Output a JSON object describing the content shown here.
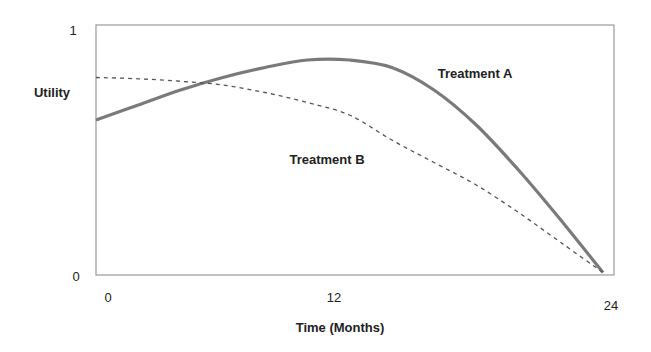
{
  "chart_data": {
    "type": "line",
    "title": "",
    "xlabel": "Time (Months)",
    "ylabel": "Utility",
    "xlim": [
      0,
      24
    ],
    "ylim": [
      0,
      1
    ],
    "x_ticks": [
      "0",
      "12",
      "24"
    ],
    "y_ticks": [
      "0",
      "1"
    ],
    "grid": false,
    "legend": "inline annotations",
    "x": [
      0,
      2,
      4,
      6,
      8,
      10,
      12,
      14,
      16,
      18,
      20,
      22,
      24
    ],
    "series": [
      {
        "name": "Treatment A",
        "style": "solid",
        "color": "#7a7a7a",
        "values": [
          0.62,
          0.68,
          0.74,
          0.79,
          0.83,
          0.86,
          0.86,
          0.83,
          0.74,
          0.6,
          0.42,
          0.22,
          0.01
        ]
      },
      {
        "name": "Treatment B",
        "style": "dashed",
        "color": "#555555",
        "values": [
          0.79,
          0.785,
          0.775,
          0.76,
          0.73,
          0.69,
          0.64,
          0.54,
          0.45,
          0.36,
          0.25,
          0.13,
          0.01
        ]
      }
    ],
    "annotations": [
      {
        "text": "Treatment A",
        "x": 17.8,
        "y": 0.81
      },
      {
        "text": "Treatment B",
        "x": 11,
        "y": 0.53
      }
    ]
  },
  "labels": {
    "y_axis": "Utility",
    "x_axis": "Time (Months)",
    "y_max": "1",
    "y_min": "0",
    "x_0": "0",
    "x_12": "12",
    "x_24": "24",
    "series_a": "Treatment A",
    "series_b": "Treatment B"
  }
}
